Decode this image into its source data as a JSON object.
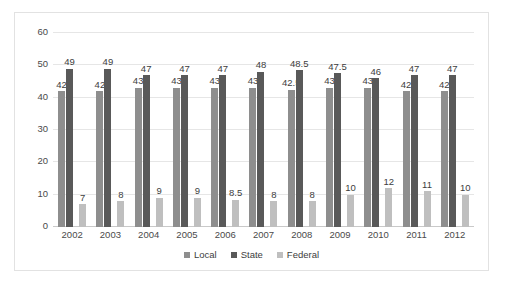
{
  "chart_data": {
    "type": "bar",
    "title": "",
    "xlabel": "",
    "ylabel": "",
    "ylim": [
      0,
      60
    ],
    "yticks": [
      0,
      10,
      20,
      30,
      40,
      50,
      60
    ],
    "grid": true,
    "legend_position": "bottom",
    "categories": [
      "2002",
      "2003",
      "2004",
      "2005",
      "2006",
      "2007",
      "2008",
      "2009",
      "2010",
      "2011",
      "2012"
    ],
    "series": [
      {
        "name": "Local",
        "color": "#8e8e8e",
        "values": [
          42,
          42,
          43,
          43,
          43,
          43,
          42.5,
          43,
          43,
          42,
          42
        ],
        "labels": [
          "42",
          "42",
          "43",
          "43",
          "43",
          "43",
          "42.5",
          "43",
          "43",
          "42",
          "42"
        ]
      },
      {
        "name": "State",
        "color": "#595959",
        "values": [
          49,
          49,
          47,
          47,
          47,
          48,
          48.5,
          47.5,
          46,
          47,
          47
        ],
        "labels": [
          "49",
          "49",
          "47",
          "47",
          "47",
          "48",
          "48.5",
          "47.5",
          "46",
          "47",
          "47"
        ]
      },
      {
        "name": "Federal",
        "color": "#bfbfbf",
        "values": [
          7,
          8,
          9,
          9,
          8.5,
          8,
          8,
          10,
          12,
          11,
          10
        ],
        "labels": [
          "7",
          "8",
          "9",
          "9",
          "8.5",
          "8",
          "8",
          "10",
          "12",
          "11",
          "10"
        ]
      }
    ]
  },
  "colors": {
    "local": "#8e8e8e",
    "state": "#595959",
    "federal": "#bfbfbf",
    "gridline": "#e6e6e6",
    "frame": "#e2e2e2",
    "text": "#3d3d3d"
  }
}
